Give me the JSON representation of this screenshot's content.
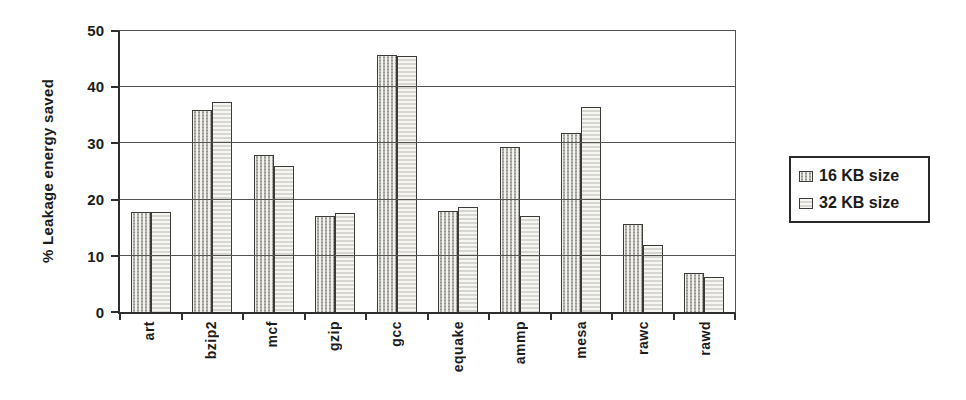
{
  "chart_data": {
    "type": "bar",
    "title": "",
    "xlabel": "",
    "ylabel": "% Leakage energy saved",
    "ylim": [
      0,
      50
    ],
    "yticks": [
      0,
      10,
      20,
      30,
      40,
      50
    ],
    "grid": true,
    "legend_position": "right",
    "categories": [
      "art",
      "bzip2",
      "mcf",
      "gzip",
      "gcc",
      "equake",
      "ammp",
      "mesa",
      "rawc",
      "rawd"
    ],
    "series": [
      {
        "name": "16 KB size",
        "pattern": "dots",
        "values": [
          17.8,
          36.0,
          28.0,
          17.0,
          45.8,
          18.0,
          29.4,
          31.8,
          15.6,
          7.0
        ]
      },
      {
        "name": "32 KB size",
        "pattern": "stripes",
        "values": [
          17.8,
          37.4,
          26.0,
          17.6,
          45.5,
          18.7,
          17.1,
          36.4,
          12.0,
          6.2
        ]
      }
    ]
  },
  "colors": {
    "background": "#ffffff",
    "text": "#1b1b1b",
    "axis": "#2e2e2c",
    "grid": "#55534f",
    "bar_outline": "#3d3b38",
    "bar_fill_dots": "#f1f1ee",
    "bar_dot": "#96948e",
    "bar_fill_stripes": "#f6f6f3",
    "bar_stripe": "#d7d6d1",
    "legend_border": "#2b2a28"
  }
}
